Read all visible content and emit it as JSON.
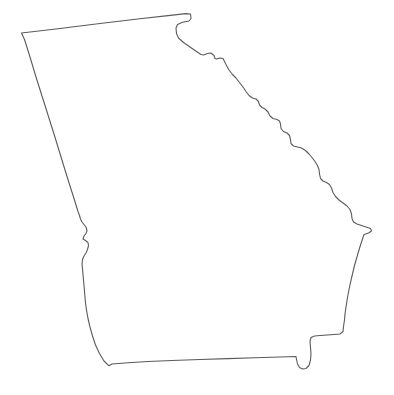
{
  "document": {
    "type": "outline-map",
    "title": "Georgia State Outline Map",
    "subject": "Georgia",
    "country": "United States of America",
    "description": "Blank black-and-white outline map of the U.S. state of Georgia",
    "labels_visible": false,
    "background_color": "#ffffff",
    "outline_color": "#5a5a5a",
    "fill_color": "#ffffff",
    "stroke_width": 1.1,
    "canvas": {
      "width": 394,
      "height": 395
    }
  },
  "map_data": {
    "type": "polygon-outline",
    "region_name": "Georgia",
    "view_box": "0 0 394 395",
    "features": [
      {
        "name": "georgia-state-boundary",
        "closed": true,
        "segments": [
          {
            "name": "northern-border-tennessee-north-carolina",
            "note": "straight east-west line along 35th parallel"
          },
          {
            "name": "northeast-notch",
            "note": "small re-entrant at the Ellicott Rock / NC corner"
          },
          {
            "name": "savannah-river-border-south-carolina",
            "note": "stair-stepped northeast diagonal"
          },
          {
            "name": "atlantic-coastline",
            "note": "eastern seaboard"
          },
          {
            "name": "saint-marys-river-border-florida",
            "note": "southeast notch"
          },
          {
            "name": "southern-border-florida",
            "note": "near-straight east-west line"
          },
          {
            "name": "chattahoochee-river-border-alabama",
            "note": "southwest sinuous river line"
          },
          {
            "name": "western-border-alabama",
            "note": "straight northwest diagonal"
          }
        ],
        "points": [
          [
            21.5,
            33.0
          ],
          [
            60.0,
            28.5
          ],
          [
            100.0,
            23.5
          ],
          [
            140.0,
            18.8
          ],
          [
            168.0,
            15.6
          ],
          [
            186.0,
            13.6
          ],
          [
            190.5,
            14.0
          ],
          [
            191.0,
            18.5
          ],
          [
            189.0,
            21.0
          ],
          [
            182.5,
            22.3
          ],
          [
            177.5,
            24.5
          ],
          [
            176.0,
            28.0
          ],
          [
            176.5,
            33.5
          ],
          [
            178.5,
            38.0
          ],
          [
            183.5,
            42.5
          ],
          [
            190.0,
            47.0
          ],
          [
            196.5,
            51.5
          ],
          [
            201.0,
            54.5
          ],
          [
            203.5,
            55.0
          ],
          [
            207.5,
            53.5
          ],
          [
            211.0,
            53.0
          ],
          [
            214.0,
            55.5
          ],
          [
            215.0,
            58.5
          ],
          [
            216.5,
            59.0
          ],
          [
            220.0,
            58.0
          ],
          [
            223.0,
            58.5
          ],
          [
            224.5,
            61.5
          ],
          [
            226.5,
            65.5
          ],
          [
            229.0,
            70.0
          ],
          [
            232.5,
            74.5
          ],
          [
            236.0,
            78.0
          ],
          [
            239.5,
            82.5
          ],
          [
            243.0,
            87.0
          ],
          [
            246.0,
            91.5
          ],
          [
            249.0,
            95.5
          ],
          [
            252.5,
            98.0
          ],
          [
            256.0,
            99.0
          ],
          [
            258.5,
            101.5
          ],
          [
            259.5,
            105.0
          ],
          [
            262.0,
            107.5
          ],
          [
            265.0,
            109.0
          ],
          [
            268.0,
            112.0
          ],
          [
            270.0,
            116.0
          ],
          [
            273.0,
            118.5
          ],
          [
            277.0,
            119.5
          ],
          [
            279.5,
            121.0
          ],
          [
            280.5,
            124.0
          ],
          [
            281.0,
            128.5
          ],
          [
            283.5,
            131.5
          ],
          [
            287.0,
            133.0
          ],
          [
            289.5,
            135.5
          ],
          [
            290.5,
            139.5
          ],
          [
            291.0,
            143.5
          ],
          [
            293.5,
            146.0
          ],
          [
            297.5,
            147.0
          ],
          [
            301.5,
            148.0
          ],
          [
            305.5,
            150.5
          ],
          [
            309.0,
            154.0
          ],
          [
            312.0,
            157.5
          ],
          [
            315.0,
            161.5
          ],
          [
            317.5,
            165.5
          ],
          [
            319.0,
            169.5
          ],
          [
            319.5,
            174.0
          ],
          [
            320.5,
            178.5
          ],
          [
            323.0,
            181.0
          ],
          [
            326.5,
            182.5
          ],
          [
            329.5,
            184.5
          ],
          [
            331.5,
            188.0
          ],
          [
            333.0,
            192.5
          ],
          [
            335.5,
            196.5
          ],
          [
            339.0,
            200.0
          ],
          [
            343.0,
            203.0
          ],
          [
            347.0,
            206.0
          ],
          [
            350.0,
            209.5
          ],
          [
            351.5,
            214.0
          ],
          [
            352.0,
            218.5
          ],
          [
            353.5,
            222.0
          ],
          [
            357.0,
            224.0
          ],
          [
            361.5,
            225.5
          ],
          [
            366.0,
            227.0
          ],
          [
            370.5,
            228.5
          ],
          [
            371.5,
            231.0
          ],
          [
            368.5,
            233.0
          ],
          [
            364.0,
            234.5
          ],
          [
            360.5,
            245.0
          ],
          [
            357.5,
            255.0
          ],
          [
            354.5,
            265.5
          ],
          [
            352.0,
            276.0
          ],
          [
            349.5,
            287.0
          ],
          [
            347.5,
            297.5
          ],
          [
            346.0,
            307.0
          ],
          [
            345.0,
            314.0
          ],
          [
            344.5,
            320.0
          ],
          [
            343.5,
            326.5
          ],
          [
            343.0,
            331.5
          ],
          [
            340.0,
            334.0
          ],
          [
            334.0,
            334.5
          ],
          [
            327.0,
            335.0
          ],
          [
            320.0,
            335.5
          ],
          [
            314.5,
            336.0
          ],
          [
            311.0,
            337.5
          ],
          [
            310.0,
            341.5
          ],
          [
            310.5,
            347.5
          ],
          [
            311.0,
            354.0
          ],
          [
            310.5,
            360.0
          ],
          [
            309.0,
            365.5
          ],
          [
            306.0,
            368.5
          ],
          [
            302.5,
            369.0
          ],
          [
            299.5,
            367.5
          ],
          [
            297.5,
            364.0
          ],
          [
            296.5,
            359.5
          ],
          [
            296.0,
            356.5
          ],
          [
            280.0,
            357.0
          ],
          [
            255.0,
            357.8
          ],
          [
            228.0,
            358.6
          ],
          [
            200.0,
            359.5
          ],
          [
            172.0,
            360.5
          ],
          [
            148.0,
            361.5
          ],
          [
            128.0,
            362.8
          ],
          [
            112.0,
            364.0
          ],
          [
            109.0,
            365.8
          ],
          [
            104.0,
            361.0
          ],
          [
            99.5,
            353.5
          ],
          [
            95.5,
            345.0
          ],
          [
            92.5,
            336.0
          ],
          [
            90.0,
            327.0
          ],
          [
            88.0,
            318.5
          ],
          [
            86.5,
            310.0
          ],
          [
            85.5,
            303.0
          ],
          [
            85.0,
            297.0
          ],
          [
            84.5,
            291.0
          ],
          [
            84.0,
            285.5
          ],
          [
            83.5,
            280.0
          ],
          [
            83.0,
            274.5
          ],
          [
            82.5,
            269.0
          ],
          [
            82.0,
            264.0
          ],
          [
            82.5,
            259.5
          ],
          [
            84.0,
            256.0
          ],
          [
            86.0,
            253.0
          ],
          [
            87.5,
            249.5
          ],
          [
            88.5,
            245.5
          ],
          [
            88.0,
            242.5
          ],
          [
            85.5,
            240.5
          ],
          [
            83.0,
            239.0
          ],
          [
            84.0,
            236.0
          ],
          [
            86.0,
            233.5
          ],
          [
            87.0,
            230.5
          ],
          [
            86.0,
            227.0
          ],
          [
            84.0,
            224.5
          ],
          [
            82.0,
            222.0
          ],
          [
            80.5,
            219.0
          ],
          [
            79.5,
            215.5
          ],
          [
            78.0,
            211.5
          ],
          [
            74.5,
            200.0
          ],
          [
            70.0,
            186.0
          ],
          [
            65.0,
            170.0
          ],
          [
            59.5,
            152.0
          ],
          [
            54.0,
            134.0
          ],
          [
            48.0,
            115.0
          ],
          [
            42.0,
            96.0
          ],
          [
            36.0,
            77.0
          ],
          [
            30.0,
            57.0
          ],
          [
            24.5,
            39.5
          ],
          [
            21.5,
            33.0
          ]
        ]
      }
    ]
  }
}
